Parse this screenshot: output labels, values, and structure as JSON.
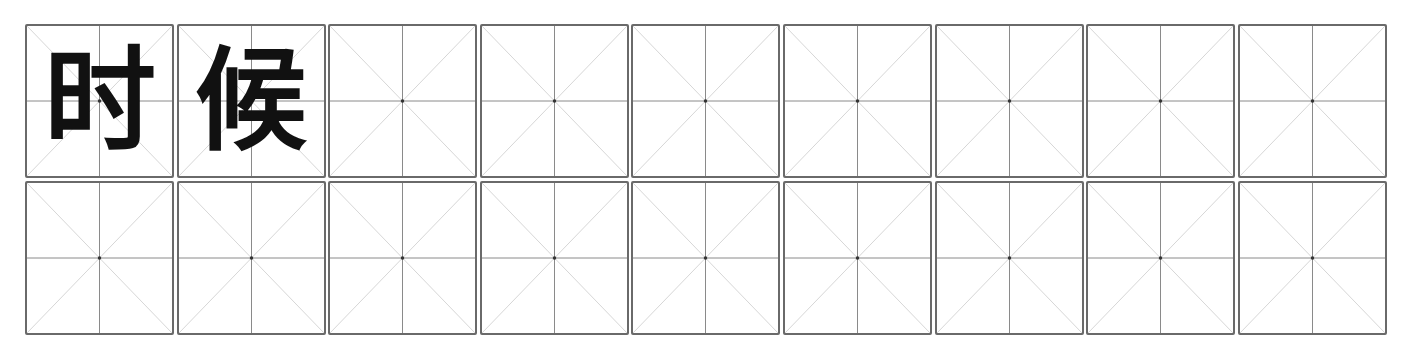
{
  "worksheet": {
    "type": "mi-zi-ge practice grid",
    "rows": 2,
    "columns": 9,
    "cells": [
      {
        "char": "时"
      },
      {
        "char": "候"
      },
      {
        "char": ""
      },
      {
        "char": ""
      },
      {
        "char": ""
      },
      {
        "char": ""
      },
      {
        "char": ""
      },
      {
        "char": ""
      },
      {
        "char": ""
      },
      {
        "char": ""
      },
      {
        "char": ""
      },
      {
        "char": ""
      },
      {
        "char": ""
      },
      {
        "char": ""
      },
      {
        "char": ""
      },
      {
        "char": ""
      },
      {
        "char": ""
      },
      {
        "char": ""
      }
    ],
    "colors": {
      "border": "#6a6a6a",
      "center_lines": "#8a8a8a",
      "diagonals": "#c4c4c4",
      "character": "#111111"
    }
  }
}
